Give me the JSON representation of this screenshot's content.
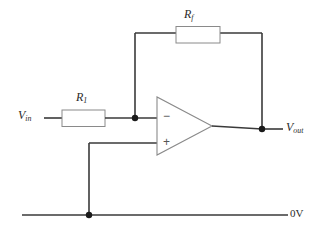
{
  "diagram": {
    "stroke_color": "#3a3a3a",
    "component_outline_color": "#8a8a8a",
    "background_color": "#ffffff",
    "labels": {
      "feedback_resistor": "R",
      "feedback_resistor_sub": "f",
      "input_resistor": "R",
      "input_resistor_sub": "1",
      "input_voltage": "V",
      "input_voltage_sub": "in",
      "output_voltage": "V",
      "output_voltage_sub": "out",
      "ground_rail": "0V"
    },
    "opamp": {
      "inverting_terminal": "−",
      "noninverting_terminal": "+"
    }
  }
}
